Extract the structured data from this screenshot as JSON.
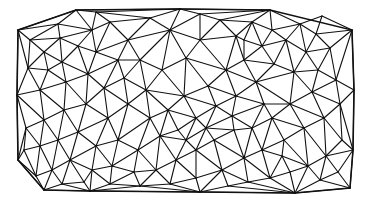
{
  "diagram": {
    "type": "triangulated-mesh",
    "background": "#ffffff",
    "stroke_color": "#111111",
    "stroke_width": 1.1,
    "hull": [
      [
        18,
        30
      ],
      [
        76,
        10
      ],
      [
        180,
        9
      ],
      [
        270,
        10
      ],
      [
        352,
        30
      ],
      [
        354,
        90
      ],
      [
        353,
        150
      ],
      [
        350,
        188
      ],
      [
        295,
        193
      ],
      [
        200,
        192
      ],
      [
        90,
        191
      ],
      [
        44,
        190
      ],
      [
        18,
        160
      ],
      [
        17,
        95
      ]
    ],
    "interior_points": [
      [
        30,
        40
      ],
      [
        44,
        52
      ],
      [
        60,
        38
      ],
      [
        92,
        30
      ],
      [
        110,
        22
      ],
      [
        128,
        40
      ],
      [
        150,
        18
      ],
      [
        170,
        30
      ],
      [
        140,
        60
      ],
      [
        118,
        60
      ],
      [
        96,
        52
      ],
      [
        78,
        46
      ],
      [
        62,
        62
      ],
      [
        48,
        70
      ],
      [
        28,
        68
      ],
      [
        40,
        90
      ],
      [
        66,
        82
      ],
      [
        88,
        74
      ],
      [
        104,
        88
      ],
      [
        124,
        78
      ],
      [
        146,
        90
      ],
      [
        162,
        70
      ],
      [
        186,
        58
      ],
      [
        200,
        40
      ],
      [
        220,
        20
      ],
      [
        236,
        36
      ],
      [
        252,
        22
      ],
      [
        262,
        46
      ],
      [
        244,
        60
      ],
      [
        226,
        70
      ],
      [
        208,
        86
      ],
      [
        184,
        96
      ],
      [
        168,
        110
      ],
      [
        150,
        118
      ],
      [
        128,
        104
      ],
      [
        108,
        118
      ],
      [
        86,
        104
      ],
      [
        64,
        110
      ],
      [
        44,
        120
      ],
      [
        26,
        128
      ],
      [
        24,
        150
      ],
      [
        40,
        146
      ],
      [
        58,
        140
      ],
      [
        78,
        132
      ],
      [
        96,
        146
      ],
      [
        118,
        140
      ],
      [
        138,
        150
      ],
      [
        160,
        136
      ],
      [
        178,
        130
      ],
      [
        196,
        118
      ],
      [
        216,
        106
      ],
      [
        236,
        96
      ],
      [
        256,
        82
      ],
      [
        274,
        64
      ],
      [
        286,
        40
      ],
      [
        300,
        24
      ],
      [
        316,
        34
      ],
      [
        330,
        48
      ],
      [
        306,
        52
      ],
      [
        294,
        72
      ],
      [
        318,
        70
      ],
      [
        336,
        80
      ],
      [
        312,
        92
      ],
      [
        290,
        104
      ],
      [
        272,
        118
      ],
      [
        252,
        128
      ],
      [
        234,
        130
      ],
      [
        214,
        140
      ],
      [
        196,
        150
      ],
      [
        176,
        160
      ],
      [
        156,
        170
      ],
      [
        134,
        172
      ],
      [
        112,
        166
      ],
      [
        92,
        170
      ],
      [
        70,
        160
      ],
      [
        52,
        170
      ],
      [
        36,
        176
      ],
      [
        62,
        184
      ],
      [
        84,
        182
      ],
      [
        110,
        184
      ],
      [
        140,
        186
      ],
      [
        170,
        184
      ],
      [
        196,
        178
      ],
      [
        222,
        170
      ],
      [
        244,
        158
      ],
      [
        262,
        150
      ],
      [
        284,
        140
      ],
      [
        304,
        128
      ],
      [
        324,
        118
      ],
      [
        340,
        104
      ],
      [
        342,
        140
      ],
      [
        326,
        156
      ],
      [
        308,
        166
      ],
      [
        290,
        172
      ],
      [
        270,
        178
      ],
      [
        248,
        182
      ],
      [
        228,
        186
      ],
      [
        320,
        180
      ],
      [
        338,
        172
      ],
      [
        282,
        156
      ],
      [
        264,
        104
      ],
      [
        232,
        116
      ],
      [
        206,
        128
      ],
      [
        186,
        140
      ],
      [
        244,
        40
      ],
      [
        272,
        30
      ],
      [
        322,
        16
      ],
      [
        200,
        14
      ],
      [
        96,
        12
      ],
      [
        58,
        24
      ]
    ]
  }
}
